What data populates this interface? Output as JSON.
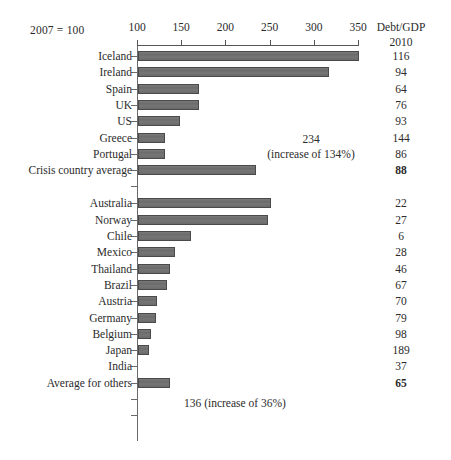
{
  "base_note": "2007 = 100",
  "right_column": {
    "header": "Debt/GDP",
    "subheader": "2010"
  },
  "axis": {
    "ticks": [
      100,
      150,
      200,
      250,
      300,
      350
    ],
    "tick_labels": [
      "100",
      "150",
      "200",
      "250",
      "300",
      "350"
    ],
    "min": 100,
    "max": 350
  },
  "annotations": {
    "crisis": {
      "line1": "234",
      "line2": "(increase of 134%)"
    },
    "others": "136 (increase of 36%)"
  },
  "chart_data": {
    "type": "bar",
    "orientation": "horizontal",
    "title": "",
    "subtitle": "",
    "xlabel": "2007 = 100",
    "ylabel": "",
    "xlim": [
      100,
      350
    ],
    "grid": false,
    "legend": "none",
    "baseline": 100,
    "categories": [
      "Iceland",
      "Ireland",
      "Spain",
      "UK",
      "US",
      "Greece",
      "Portugal",
      "Crisis country average",
      "Australia",
      "Norway",
      "Chile",
      "Mexico",
      "Thailand",
      "Brazil",
      "Austria",
      "Germany",
      "Belgium",
      "Japan",
      "India",
      "Average for others"
    ],
    "values": [
      350,
      316,
      169,
      169,
      148,
      131,
      130,
      234,
      250,
      247,
      160,
      142,
      136,
      133,
      122,
      120,
      115,
      113,
      100,
      136
    ],
    "series": [
      {
        "name": "Real government spending index (2007 = 100)",
        "values": [
          350,
          316,
          169,
          169,
          148,
          131,
          130,
          234,
          250,
          247,
          160,
          142,
          136,
          133,
          122,
          120,
          115,
          113,
          100,
          136
        ]
      },
      {
        "name": "Debt/GDP 2010",
        "values": [
          116,
          94,
          64,
          76,
          93,
          144,
          86,
          88,
          22,
          27,
          6,
          28,
          46,
          67,
          70,
          79,
          98,
          189,
          37,
          65
        ]
      }
    ],
    "annotations": [
      {
        "target": "Crisis country average",
        "text": "234 (increase of 134%)"
      },
      {
        "target": "Average for others",
        "text": "136 (increase of 36%)"
      }
    ]
  },
  "rows": [
    {
      "label": "Iceland",
      "value": 350,
      "debt": "116",
      "bold": false,
      "group": "crisis"
    },
    {
      "label": "Ireland",
      "value": 316,
      "debt": "94",
      "bold": false,
      "group": "crisis"
    },
    {
      "label": "Spain",
      "value": 169,
      "debt": "64",
      "bold": false,
      "group": "crisis"
    },
    {
      "label": "UK",
      "value": 169,
      "debt": "76",
      "bold": false,
      "group": "crisis"
    },
    {
      "label": "US",
      "value": 148,
      "debt": "93",
      "bold": false,
      "group": "crisis"
    },
    {
      "label": "Greece",
      "value": 131,
      "debt": "144",
      "bold": false,
      "group": "crisis"
    },
    {
      "label": "Portugal",
      "value": 130,
      "debt": "86",
      "bold": false,
      "group": "crisis"
    },
    {
      "label": "Crisis country average",
      "value": 234,
      "debt": "88",
      "bold": true,
      "group": "crisis"
    },
    {
      "label": "Australia",
      "value": 250,
      "debt": "22",
      "bold": false,
      "group": "others"
    },
    {
      "label": "Norway",
      "value": 247,
      "debt": "27",
      "bold": false,
      "group": "others"
    },
    {
      "label": "Chile",
      "value": 160,
      "debt": "6",
      "bold": false,
      "group": "others"
    },
    {
      "label": "Mexico",
      "value": 142,
      "debt": "28",
      "bold": false,
      "group": "others"
    },
    {
      "label": "Thailand",
      "value": 136,
      "debt": "46",
      "bold": false,
      "group": "others"
    },
    {
      "label": "Brazil",
      "value": 133,
      "debt": "67",
      "bold": false,
      "group": "others"
    },
    {
      "label": "Austria",
      "value": 122,
      "debt": "70",
      "bold": false,
      "group": "others"
    },
    {
      "label": "Germany",
      "value": 120,
      "debt": "79",
      "bold": false,
      "group": "others"
    },
    {
      "label": "Belgium",
      "value": 115,
      "debt": "98",
      "bold": false,
      "group": "others"
    },
    {
      "label": "Japan",
      "value": 113,
      "debt": "189",
      "bold": false,
      "group": "others"
    },
    {
      "label": "India",
      "value": 100,
      "debt": "37",
      "bold": false,
      "group": "others"
    },
    {
      "label": "Average for others",
      "value": 136,
      "debt": "65",
      "bold": true,
      "group": "others"
    }
  ]
}
